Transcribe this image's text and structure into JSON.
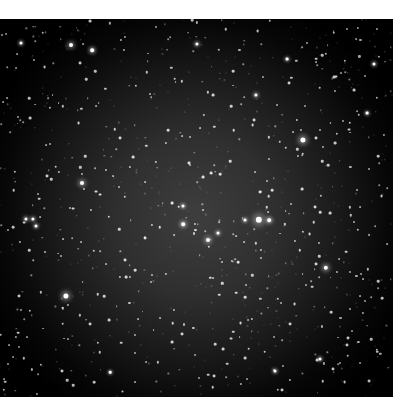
{
  "image": {
    "subject": "star field",
    "background_center_color": "#3e3e3e",
    "background_edge_color": "#000000",
    "star_color": "#ffffff",
    "bright_stars": [
      {
        "x": 259,
        "y": 201,
        "r": 3.2
      },
      {
        "x": 303,
        "y": 121,
        "r": 2.6
      },
      {
        "x": 66,
        "y": 277,
        "r": 2.6
      },
      {
        "x": 326,
        "y": 249,
        "r": 2.2
      },
      {
        "x": 82,
        "y": 164,
        "r": 2.0
      },
      {
        "x": 71,
        "y": 26,
        "r": 2.0
      },
      {
        "x": 92,
        "y": 31,
        "r": 1.8
      },
      {
        "x": 197,
        "y": 25,
        "r": 1.6
      },
      {
        "x": 208,
        "y": 221,
        "r": 2.0
      },
      {
        "x": 183,
        "y": 205,
        "r": 1.8
      },
      {
        "x": 269,
        "y": 201,
        "r": 1.8
      },
      {
        "x": 245,
        "y": 201,
        "r": 1.5
      },
      {
        "x": 218,
        "y": 214,
        "r": 1.5
      },
      {
        "x": 183,
        "y": 187,
        "r": 1.5
      },
      {
        "x": 26,
        "y": 200,
        "r": 1.6
      },
      {
        "x": 33,
        "y": 200,
        "r": 1.6
      },
      {
        "x": 36,
        "y": 207,
        "r": 1.5
      },
      {
        "x": 21,
        "y": 24,
        "r": 1.5
      },
      {
        "x": 256,
        "y": 76,
        "r": 1.6
      },
      {
        "x": 287,
        "y": 40,
        "r": 1.4
      },
      {
        "x": 374,
        "y": 45,
        "r": 1.5
      },
      {
        "x": 367,
        "y": 94,
        "r": 1.4
      },
      {
        "x": 110,
        "y": 353,
        "r": 1.3
      },
      {
        "x": 275,
        "y": 352,
        "r": 1.5
      },
      {
        "x": 320,
        "y": 340,
        "r": 1.5
      }
    ],
    "faint_star_count": 900,
    "faint_star_seed": 7
  }
}
